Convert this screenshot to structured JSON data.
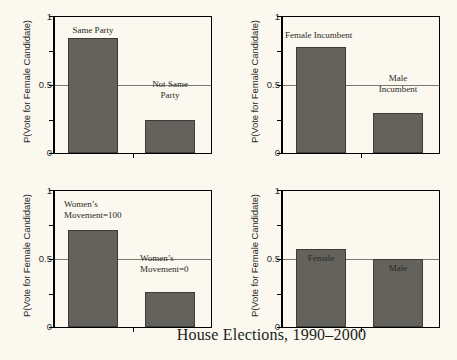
{
  "figure": {
    "title": "House Elections, 1990–2000",
    "axis_title_y": "P(Vote for Female Candidate)",
    "tick_labels": {
      "top": "1",
      "mid": "0.5",
      "bottom": "0"
    },
    "bar_color": "#63625c",
    "background_color": "#faf8ef",
    "gridline_color": "#7b7a72"
  },
  "chart_data": [
    {
      "type": "bar",
      "panel": "top-left",
      "categories": [
        "Same Party",
        "Not Same Party"
      ],
      "values": [
        0.845,
        0.245
      ],
      "title": "",
      "xlabel": "",
      "ylabel": "P(Vote for Female Candidate)",
      "ylim": [
        0,
        1
      ],
      "yticks": [
        0,
        0.5,
        1
      ],
      "ytick_labels": [
        "0",
        "0.5",
        "1"
      ],
      "grid": true,
      "legend": "none",
      "annotations": [
        {
          "text": "Same Party",
          "bar": 0,
          "position": "above-bar"
        },
        {
          "text": "Not Same\nParty",
          "bar": 1,
          "position": "above-bar"
        }
      ]
    },
    {
      "type": "bar",
      "panel": "top-right",
      "categories": [
        "Female Incumbent",
        "Male Incumbent"
      ],
      "values": [
        0.78,
        0.295
      ],
      "title": "",
      "xlabel": "",
      "ylabel": "P(Vote for Female Candidate)",
      "ylim": [
        0,
        1
      ],
      "yticks": [
        0,
        0.5,
        1
      ],
      "ytick_labels": [
        "0",
        "0.5",
        "1"
      ],
      "grid": true,
      "legend": "none",
      "annotations": [
        {
          "text": "Female Incumbent",
          "bar": 0,
          "position": "above-bar"
        },
        {
          "text": "Male\nIncumbent",
          "bar": 1,
          "position": "above-bar"
        }
      ]
    },
    {
      "type": "bar",
      "panel": "bottom-left",
      "categories": [
        "Women's Movement=100",
        "Women's Movement=0"
      ],
      "values": [
        0.71,
        0.26
      ],
      "title": "",
      "xlabel": "",
      "ylabel": "P(Vote for Female Candidate)",
      "ylim": [
        0,
        1
      ],
      "yticks": [
        0,
        0.5,
        1
      ],
      "ytick_labels": [
        "0",
        "0.5",
        "1"
      ],
      "grid": true,
      "legend": "none",
      "annotations": [
        {
          "text": "Women’s\nMovement=100",
          "bar": 0,
          "position": "above-bar"
        },
        {
          "text": "Women’s\nMovement=0",
          "bar": 1,
          "position": "above-bar"
        }
      ]
    },
    {
      "type": "bar",
      "panel": "bottom-right",
      "categories": [
        "Female",
        "Male"
      ],
      "values": [
        0.575,
        0.5
      ],
      "title": "",
      "xlabel": "",
      "ylabel": "P(Vote for Female Candidate)",
      "ylim": [
        0,
        1
      ],
      "yticks": [
        0,
        0.5,
        1
      ],
      "ytick_labels": [
        "0",
        "0.5",
        "1"
      ],
      "grid": true,
      "legend": "none",
      "annotations": [
        {
          "text": "Female",
          "bar": 0,
          "position": "above-bar"
        },
        {
          "text": "Male",
          "bar": 1,
          "position": "above-bar"
        }
      ]
    }
  ],
  "panels": {
    "tl": {
      "ylabel": "P(Vote for Female Candidate)",
      "t1": "1",
      "t05": "0.5",
      "t0": "0",
      "bar1_label": "Same Party",
      "bar2_label": "Not Same\nParty"
    },
    "tr": {
      "ylabel": "P(Vote for Female Candidate)",
      "t1": "1",
      "t05": "0.5",
      "t0": "0",
      "bar1_label": "Female Incumbent",
      "bar2_label": "Male\nIncumbent"
    },
    "bl": {
      "ylabel": "P(Vote for Female Candidate)",
      "t1": "1",
      "t05": "0.5",
      "t0": "0",
      "bar1_label": "Women’s\nMovement=100",
      "bar2_label": "Women’s\nMovement=0"
    },
    "br": {
      "ylabel": "P(Vote for Female Candidate)",
      "t1": "1",
      "t05": "0.5",
      "t0": "0",
      "bar1_label": "Female",
      "bar2_label": "Male"
    }
  }
}
